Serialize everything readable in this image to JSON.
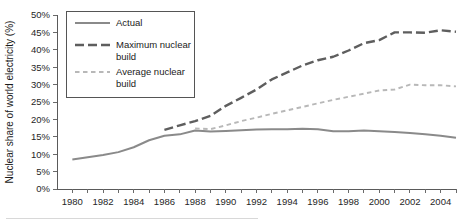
{
  "chart_data": {
    "type": "line",
    "title": "",
    "xlabel": "",
    "ylabel": "Nuclear share of world electricity (%)",
    "xlim": [
      1979,
      2005
    ],
    "ylim": [
      0,
      50
    ],
    "ytick_step": 5,
    "grid": false,
    "legend_position": "top-left",
    "x": [
      1980,
      1981,
      1982,
      1983,
      1984,
      1985,
      1986,
      1987,
      1988,
      1989,
      1990,
      1991,
      1992,
      1993,
      1994,
      1995,
      1996,
      1997,
      1998,
      1999,
      2000,
      2001,
      2002,
      2003,
      2004,
      2005
    ],
    "xtick_labels": [
      "1980",
      "1982",
      "1984",
      "1986",
      "1988",
      "1990",
      "1992",
      "1994",
      "1996",
      "1998",
      "2000",
      "2002",
      "2004"
    ],
    "ytick_labels": [
      "0%",
      "5%",
      "10%",
      "15%",
      "20%",
      "25%",
      "30%",
      "35%",
      "40%",
      "45%",
      "50%"
    ],
    "series": [
      {
        "name": "Actual",
        "style": "solid",
        "color": "#8a8a8a",
        "x": [
          1980,
          1981,
          1982,
          1983,
          1984,
          1985,
          1986,
          1987,
          1988,
          1989,
          1990,
          1991,
          1992,
          1993,
          1994,
          1995,
          1996,
          1997,
          1998,
          1999,
          2000,
          2001,
          2002,
          2003,
          2004,
          2005
        ],
        "values": [
          8.5,
          9.1,
          9.8,
          10.6,
          12.0,
          14.0,
          15.3,
          15.7,
          16.8,
          16.5,
          16.7,
          16.9,
          17.1,
          17.2,
          17.2,
          17.3,
          17.2,
          16.6,
          16.6,
          16.8,
          16.6,
          16.4,
          16.1,
          15.7,
          15.3,
          14.7
        ]
      },
      {
        "name": "Maximum nuclear build",
        "style": "long-dash",
        "color": "#5e5e5e",
        "x": [
          1986,
          1987,
          1988,
          1989,
          1990,
          1991,
          1992,
          1993,
          1994,
          1995,
          1996,
          1997,
          1998,
          1999,
          2000,
          2001,
          2002,
          2003,
          2004,
          2005
        ],
        "values": [
          17.0,
          18.3,
          19.5,
          21.0,
          23.9,
          26.2,
          28.6,
          31.5,
          33.5,
          35.5,
          37.0,
          38.0,
          39.8,
          41.9,
          42.8,
          45.0,
          45.0,
          44.9,
          45.6,
          45.2
        ]
      },
      {
        "name": "Average nuclear build",
        "style": "short-dash",
        "color": "#b8b8b8",
        "x": [
          1988,
          1989,
          1990,
          1991,
          1992,
          1993,
          1994,
          1995,
          1996,
          1997,
          1998,
          1999,
          2000,
          2001,
          2002,
          2003,
          2004,
          2005
        ],
        "values": [
          17.4,
          17.2,
          18.3,
          19.5,
          20.5,
          21.6,
          22.6,
          23.6,
          24.6,
          25.6,
          26.5,
          27.4,
          28.3,
          28.6,
          30.0,
          29.8,
          29.8,
          29.5
        ]
      }
    ]
  },
  "legend": {
    "items": [
      {
        "label": "Actual"
      },
      {
        "label": "Maximum nuclear build"
      },
      {
        "label": "Average nuclear build"
      }
    ]
  }
}
